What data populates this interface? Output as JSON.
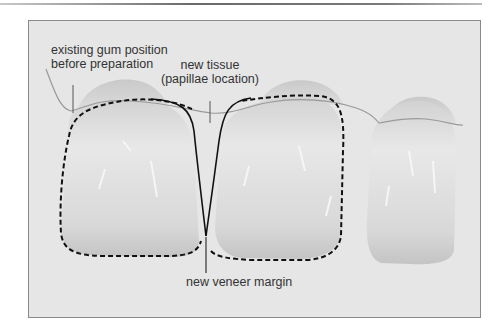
{
  "figure": {
    "labels": {
      "gum_line_1": "existing gum position",
      "gum_line_2": "before preparation",
      "tissue_line_1": "new tissue",
      "tissue_line_2": "(papillae location)",
      "margin": "new veneer margin"
    },
    "colors": {
      "background": "#e6e6e6",
      "tooth": "#dcdcdc",
      "outline": "#111111",
      "gum_line": "#9a9a9a"
    }
  }
}
